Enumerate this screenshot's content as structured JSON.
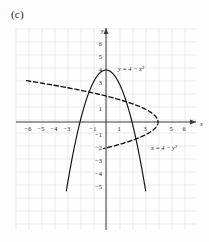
{
  "figure": {
    "panel_label": "(c)",
    "background_color": "#fefefe",
    "grid_color": "#e2e2e2",
    "axis_color": "#3a3a3a",
    "curve_color": "#111111"
  },
  "axes": {
    "x_axis_name": "x",
    "y_axis_name": "y",
    "x_range": [
      -7,
      7
    ],
    "y_range": [
      -5.6,
      6.6
    ],
    "x_tick_labels": [
      "-6",
      "-5",
      "-4",
      "-3",
      "-1",
      "1",
      "3",
      "5",
      "6"
    ],
    "x_tick_values": [
      -6,
      -5,
      -4,
      -3,
      -1,
      1,
      3,
      5,
      6
    ],
    "y_tick_labels": [
      "6",
      "5",
      "4",
      "3",
      "1",
      "-1",
      "-2",
      "-3",
      "-4",
      "-5"
    ],
    "y_tick_values": [
      6,
      5,
      4,
      3,
      1,
      -1,
      -2,
      -3,
      -4,
      -5
    ],
    "grid": true
  },
  "chart_data": {
    "type": "line",
    "title": "(c)",
    "xlabel": "x",
    "ylabel": "y",
    "xlim": [
      -7,
      7
    ],
    "ylim": [
      -5.6,
      6.6
    ],
    "grid": true,
    "legend": "inline-annotations",
    "series": [
      {
        "name": "y = 4 - x^2",
        "label": "y = 4 − x²",
        "style": "solid",
        "equation": "y = 4 - x^2",
        "vertex": [
          0,
          4
        ],
        "x_intercepts": [
          -2,
          2
        ],
        "domain_drawn": [
          -3.05,
          3.05
        ],
        "label_position": [
          0.8,
          4.1
        ]
      },
      {
        "name": "x = 4 - y^2",
        "label": "x = 4 − y²",
        "style": "dashed",
        "equation": "x = 4 - y^2",
        "vertex": [
          4,
          0
        ],
        "y_intercepts": [
          -2,
          2
        ],
        "range_drawn": [
          -2.05,
          3.18
        ],
        "label_position": [
          3.55,
          -1.25
        ]
      }
    ]
  }
}
